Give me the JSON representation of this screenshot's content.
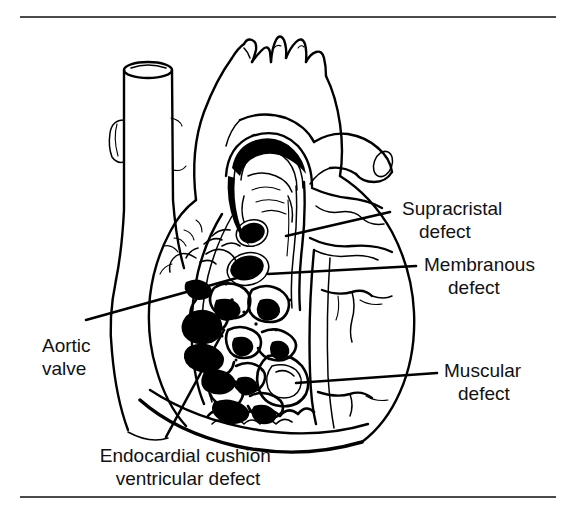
{
  "figure": {
    "type": "anatomical-line-drawing",
    "background_color": "#ffffff",
    "ink_color": "#000000",
    "rule_color": "#4a4a4a"
  },
  "rules": {
    "top": {
      "y": 17,
      "x_start": 20,
      "x_end": 556
    },
    "bottom": {
      "y": 497,
      "x_start": 20,
      "x_end": 556
    }
  },
  "labels": [
    {
      "id": "supracristal",
      "line1": "Supracristal",
      "line2": "defect",
      "text_x": 402,
      "text_y": 215,
      "align": "start",
      "leader": {
        "x1": 390,
        "y1": 212,
        "x2": 286,
        "y2": 236
      }
    },
    {
      "id": "membranous",
      "line1": "Membranous",
      "line2": "defect",
      "text_x": 424,
      "text_y": 271,
      "align": "start",
      "leader": {
        "x1": 416,
        "y1": 266,
        "x2": 268,
        "y2": 274
      }
    },
    {
      "id": "muscular",
      "line1": "Muscular",
      "line2": "defect",
      "text_x": 444,
      "text_y": 377,
      "align": "start",
      "leader": {
        "x1": 437,
        "y1": 373,
        "x2": 296,
        "y2": 383
      }
    },
    {
      "id": "aortic-valve",
      "line1": "Aortic",
      "line2": "valve",
      "text_x": 92,
      "text_y": 352,
      "align": "start",
      "leader": {
        "x1": 86,
        "y1": 320,
        "x2": 258,
        "y2": 272
      }
    },
    {
      "id": "endocardial-cushion",
      "line1": "Endocardial cushion",
      "line2": "ventricular defect",
      "text_x": 188,
      "text_y": 462,
      "align": "middle",
      "leader": {
        "x1": 166,
        "y1": 437,
        "x2": 224,
        "y2": 330
      }
    }
  ],
  "defects": [
    {
      "id": "supracristal-opening",
      "cx": 252,
      "cy": 233,
      "rx": 13,
      "ry": 10,
      "rotate": -18
    },
    {
      "id": "membranous-opening",
      "cx": 247,
      "cy": 268,
      "rx": 17,
      "ry": 12,
      "rotate": -14
    }
  ],
  "structures": [
    {
      "id": "superior-vena-cava",
      "note": "left vertical vessel with elliptical open lumen at top"
    },
    {
      "id": "aortic-arch",
      "note": "central arch with three brachiocephalic branch vessels"
    },
    {
      "id": "pulmonary-artery",
      "note": "vessel crossing to the right of the aortic arch"
    },
    {
      "id": "right-ventricle-wall",
      "note": "large smooth right-side chamber border"
    },
    {
      "id": "interventricular-septum",
      "note": "heavily trabeculated cut surface in the centre"
    },
    {
      "id": "cardiac-apex",
      "note": "sweeping curve at the lower border"
    }
  ]
}
